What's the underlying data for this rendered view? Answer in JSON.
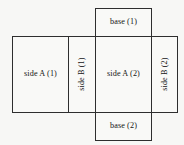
{
  "diagram": {
    "type": "box-net",
    "background_color": "#f7f7f5",
    "line_color": "#2e2e2e",
    "faces": [
      {
        "id": "base-1",
        "label": "base (1)",
        "orientation": "horizontal",
        "position": "top-middle"
      },
      {
        "id": "side-a-1",
        "label": "side A (1)",
        "orientation": "horizontal",
        "position": "left"
      },
      {
        "id": "side-b-1",
        "label": "side B (1)",
        "orientation": "vertical",
        "position": "center-left"
      },
      {
        "id": "side-a-2",
        "label": "side A (2)",
        "orientation": "horizontal",
        "position": "center"
      },
      {
        "id": "side-b-2",
        "label": "side B (2)",
        "orientation": "vertical",
        "position": "right"
      },
      {
        "id": "base-2",
        "label": "base (2)",
        "orientation": "horizontal",
        "position": "bottom-middle"
      }
    ]
  }
}
